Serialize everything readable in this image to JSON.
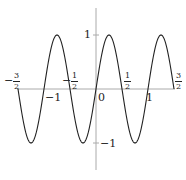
{
  "chart_data": {
    "type": "line",
    "title": "",
    "xlabel": "",
    "ylabel": "",
    "function": "y = sin(2πx)",
    "xlim": [
      -1.5,
      1.5
    ],
    "ylim": [
      -1.5,
      1.5
    ],
    "grid": false,
    "legend": null,
    "x_ticks": [
      {
        "value": -1.5,
        "label_num": "3",
        "label_den": "2",
        "sign": "−",
        "position": "above"
      },
      {
        "value": -1,
        "label": "−1",
        "position": "below"
      },
      {
        "value": -0.5,
        "label_num": "1",
        "label_den": "2",
        "sign": "−",
        "position": "above"
      },
      {
        "value": 0,
        "label": "0",
        "position": "below"
      },
      {
        "value": 0.5,
        "label_num": "1",
        "label_den": "2",
        "sign": "",
        "position": "above"
      },
      {
        "value": 1,
        "label": "1",
        "position": "below"
      },
      {
        "value": 1.5,
        "label_num": "3",
        "label_den": "2",
        "sign": "",
        "position": "above"
      }
    ],
    "y_ticks": [
      {
        "value": 1,
        "label": "1"
      },
      {
        "value": -1,
        "label": "−1"
      }
    ],
    "series": [
      {
        "name": "sin(2πx)",
        "x": [
          -1.5,
          -1.25,
          -1.0,
          -0.75,
          -0.5,
          -0.25,
          0,
          0.25,
          0.5,
          0.75,
          1.0,
          1.25,
          1.5
        ],
        "values": [
          0,
          -1,
          0,
          1,
          0,
          -1,
          0,
          1,
          0,
          -1,
          0,
          1,
          0
        ]
      }
    ],
    "colors": {
      "curve": "#222222",
      "axes": "#aaaaaa"
    }
  },
  "labels": {
    "x_m1": "−1",
    "x_0": "0",
    "x_1": "1",
    "y_1": "1",
    "y_m1": "−1",
    "minus": "−",
    "num3": "3",
    "num1": "1",
    "den2": "2"
  }
}
